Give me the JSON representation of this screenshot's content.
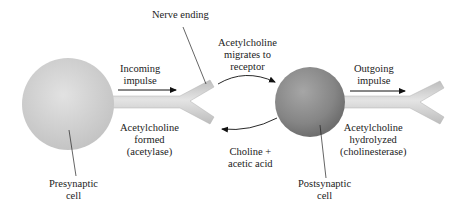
{
  "diagram": {
    "type": "cholinergic-synapse-transmission",
    "labels": {
      "nerve_ending": [
        "Nerve ending"
      ],
      "incoming_impulse": [
        "Incoming",
        "impulse"
      ],
      "migrates": [
        "Acetylcholine",
        "migrates to",
        "receptor"
      ],
      "outgoing_impulse": [
        "Outgoing",
        "impulse"
      ],
      "formed": [
        "Acetylcholine",
        "formed",
        "(acetylase)"
      ],
      "choline": [
        "Choline +",
        "acetic acid"
      ],
      "hydrolyzed": [
        "Acetylcholine",
        "hydrolyzed",
        "(cholinesterase)"
      ],
      "presynaptic": [
        "Presynaptic",
        "cell"
      ],
      "postsynaptic": [
        "Postsynaptic",
        "cell"
      ]
    },
    "nodes": [
      {
        "id": "presynaptic-cell",
        "shape": "sphere",
        "color": "#d6d6d6"
      },
      {
        "id": "postsynaptic-cell",
        "shape": "sphere",
        "color": "#8a8a8a"
      }
    ],
    "edges": [
      {
        "from": "nerve-ending",
        "to": "postsynaptic-cell",
        "label": "Acetylcholine migrates to receptor"
      },
      {
        "from": "postsynaptic-cell",
        "to": "nerve-ending",
        "label": "Choline + acetic acid"
      }
    ],
    "colors": {
      "presynaptic_fill": "#d9d9d9",
      "postsynaptic_fill": "#8c8c8c",
      "axon_fill": "#cfcfcf",
      "stroke": "#222222"
    }
  }
}
